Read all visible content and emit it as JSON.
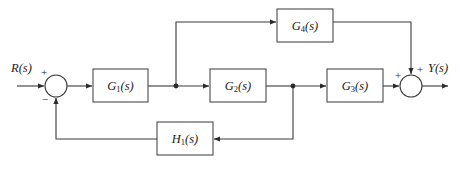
{
  "diagram": {
    "type": "signal-flow-block-diagram",
    "background_color": "#ffffff",
    "line_color": "#3a3a3a",
    "text_color": "#1a1a1a",
    "signals": {
      "input_label": "R(s)",
      "output_label": "Y(s)"
    },
    "blocks": [
      {
        "id": "G1",
        "base": "G",
        "sub": "1",
        "suffix": "(s)",
        "label": "G₁(s)",
        "x": 93,
        "y": 69,
        "w": 55,
        "h": 33
      },
      {
        "id": "G2",
        "base": "G",
        "sub": "2",
        "suffix": "(s)",
        "label": "G₂(s)",
        "x": 210,
        "y": 69,
        "w": 56,
        "h": 33
      },
      {
        "id": "G3",
        "base": "G",
        "sub": "3",
        "suffix": "(s)",
        "label": "G₃(s)",
        "x": 327,
        "y": 69,
        "w": 56,
        "h": 33
      },
      {
        "id": "G4",
        "base": "G",
        "sub": "4",
        "suffix": "(s)",
        "label": "G₄(s)",
        "x": 277,
        "y": 9,
        "w": 56,
        "h": 33
      },
      {
        "id": "H1",
        "base": "H",
        "sub": "1",
        "suffix": "(s)",
        "label": "H₁(s)",
        "x": 157,
        "y": 122,
        "w": 56,
        "h": 33
      }
    ],
    "summing_junctions": [
      {
        "id": "sum-left",
        "cx": 56,
        "cy": 86,
        "r": 11,
        "signs": [
          {
            "symbol": "+",
            "position": "top-left",
            "x": 44,
            "y": 72
          },
          {
            "symbol": "−",
            "position": "bottom-left",
            "x": 45,
            "y": 99
          }
        ]
      },
      {
        "id": "sum-right",
        "cx": 411,
        "cy": 86,
        "r": 11,
        "signs": [
          {
            "symbol": "+",
            "position": "left",
            "x": 398,
            "y": 76
          },
          {
            "symbol": "+",
            "position": "top-right",
            "x": 420,
            "y": 70
          }
        ]
      }
    ],
    "branch_points": [
      {
        "id": "branch-after-g1",
        "x": 176,
        "y": 86
      },
      {
        "id": "branch-after-g2",
        "x": 293,
        "y": 86
      }
    ],
    "connections": [
      {
        "id": "input-to-sum",
        "from": "R(s)",
        "to": "sum-left"
      },
      {
        "id": "sum-to-g1",
        "from": "sum-left",
        "to": "G1"
      },
      {
        "id": "g1-to-branch",
        "from": "G1",
        "to": "branch-after-g1"
      },
      {
        "id": "branch-up-to-g4",
        "from": "branch-after-g1",
        "to": "G4"
      },
      {
        "id": "branch-to-g2",
        "from": "branch-after-g1",
        "to": "G2"
      },
      {
        "id": "g2-to-branch2",
        "from": "G2",
        "to": "branch-after-g2"
      },
      {
        "id": "branch2-to-g3",
        "from": "branch-after-g2",
        "to": "G3"
      },
      {
        "id": "branch2-down-to-h1",
        "from": "branch-after-g2",
        "to": "H1"
      },
      {
        "id": "h1-to-sum-left",
        "from": "H1",
        "to": "sum-left"
      },
      {
        "id": "g3-to-sum-right",
        "from": "G3",
        "to": "sum-right"
      },
      {
        "id": "g4-to-sum-right",
        "from": "G4",
        "to": "sum-right"
      },
      {
        "id": "sum-right-to-output",
        "from": "sum-right",
        "to": "Y(s)"
      }
    ]
  }
}
